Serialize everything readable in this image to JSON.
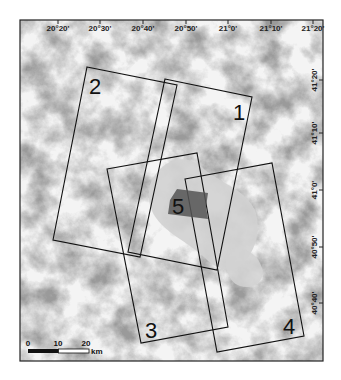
{
  "map": {
    "frame": {
      "x": 20,
      "y": 20,
      "width": 303,
      "height": 341
    },
    "colors": {
      "background": "#f4f4f4",
      "relief_dark": "#8a8a8a",
      "relief_mid": "#bdbdbd",
      "lake": "#cfcfcf",
      "area5": "#555555",
      "outline": "#111111"
    },
    "longitude_ticks": [
      {
        "label": "20°20'",
        "x": 58
      },
      {
        "label": "20°30'",
        "x": 100
      },
      {
        "label": "20°40'",
        "x": 143
      },
      {
        "label": "20°50'",
        "x": 186
      },
      {
        "label": "21°0'",
        "x": 228
      },
      {
        "label": "21°10'",
        "x": 271
      },
      {
        "label": "21°20'",
        "x": 313
      }
    ],
    "latitude_ticks": [
      {
        "label": "41°20'",
        "y": 80
      },
      {
        "label": "41°10'",
        "y": 133
      },
      {
        "label": "41°0'",
        "y": 190
      },
      {
        "label": "40°50'",
        "y": 247
      },
      {
        "label": "40°40'",
        "y": 303
      }
    ],
    "footprints": [
      {
        "id": "1",
        "label": "1",
        "points": "165,79 252,97 217,270 128,252",
        "label_x": 233,
        "label_y": 120
      },
      {
        "id": "2",
        "label": "2",
        "points": "87,67 177,85 140,257 53,240",
        "label_x": 89,
        "label_y": 94
      },
      {
        "id": "3",
        "label": "3",
        "points": "107,169 197,153 228,327 141,343",
        "label_x": 145,
        "label_y": 338
      },
      {
        "id": "4",
        "label": "4",
        "points": "185,179 272,163 304,336 217,352",
        "label_x": 283,
        "label_y": 334
      },
      {
        "id": "5",
        "label": "5",
        "points": "177,189 208,193 206,207 208,219 168,214 170,200",
        "label_x": 172,
        "label_y": 214
      }
    ],
    "scale_bar": {
      "x": 28,
      "y": 349,
      "width": 61,
      "height": 4,
      "labels": [
        {
          "text": "0",
          "x": 28
        },
        {
          "text": "10",
          "x": 58
        },
        {
          "text": "20",
          "x": 86
        }
      ],
      "unit": "km"
    }
  }
}
